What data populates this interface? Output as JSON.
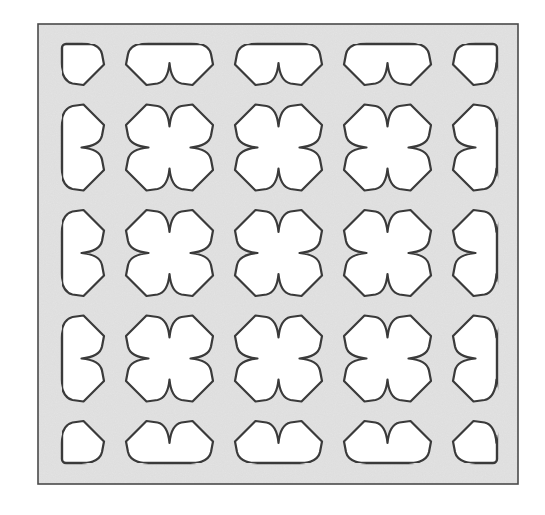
{
  "figure": {
    "kind": "perforated-panel-pattern",
    "motif": "four-petal clover cutout",
    "colors": {
      "page_background": "#ffffff",
      "panel_fill": "#e3e3e3",
      "panel_border": "#4a4a4a",
      "cutout_fill": "#ffffff",
      "cutout_stroke": "#3a3a3a"
    },
    "panel": {
      "x": 38,
      "y": 24,
      "width": 480,
      "height": 460
    },
    "cutout_region": {
      "x": 62,
      "y": 44,
      "width": 435,
      "height": 419
    },
    "grid": {
      "columns": 5,
      "rows": 5,
      "center_x": [
        60.5,
        169.5,
        278.5,
        387.5,
        496.5
      ],
      "center_y": [
        42,
        147.5,
        253,
        358.5,
        464
      ],
      "full_clovers": 9,
      "edge_half_shapes": 12,
      "corner_quarter_shapes": 4
    }
  }
}
